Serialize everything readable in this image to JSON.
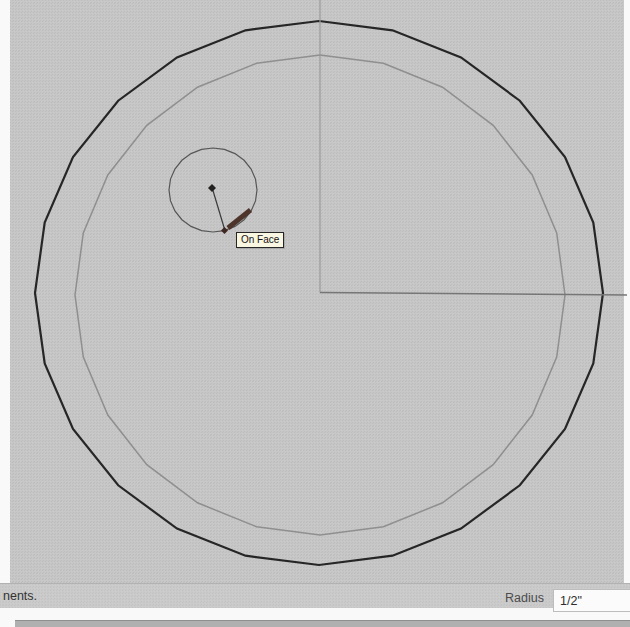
{
  "tooltip": {
    "label": "On Face",
    "bg": "#f9f6e2",
    "border": "#262626"
  },
  "status_bar": {
    "left_text": "nents.",
    "radius_label": "Radius",
    "radius_value": "1/2\""
  },
  "canvas": {
    "bg": "#c5c5c5"
  },
  "drawing": {
    "circles": [
      {
        "name": "outer-circle-edge",
        "cx": 319,
        "cy": 293,
        "rx": 284,
        "ry": 272,
        "segments": 24,
        "stroke": "#262626",
        "width": 2.2
      },
      {
        "name": "inner-circle-edge",
        "cx": 320,
        "cy": 295,
        "rx": 245,
        "ry": 240,
        "segments": 24,
        "stroke": "#8f8f8f",
        "width": 1.5
      },
      {
        "name": "new-circle-edge",
        "cx": 213,
        "cy": 190,
        "rx": 44,
        "ry": 42,
        "segments": 24,
        "stroke": "#565656",
        "width": 1.2
      }
    ],
    "lines": [
      {
        "name": "vertical-axis-edge",
        "x1": 320,
        "y1": 0,
        "x2": 320,
        "y2": 292.5,
        "stroke": "#9a9a9a",
        "width": 1.2
      },
      {
        "name": "horizontal-axis-edge",
        "x1": 320,
        "y1": 292.5,
        "x2": 627,
        "y2": 295,
        "stroke": "#767676",
        "width": 1.6
      },
      {
        "name": "radius-preview-line",
        "x1": 212.5,
        "y1": 189,
        "x2": 224.5,
        "y2": 229,
        "stroke": "#3a3a3a",
        "width": 1.2
      },
      {
        "name": "pencil-cursor",
        "x1": 228,
        "y1": 228,
        "x2": 250.5,
        "y2": 210,
        "stroke": "#4d352c",
        "width": 5,
        "cap": "butt"
      }
    ],
    "points": [
      {
        "name": "circle-center-point",
        "x": 212,
        "y": 188,
        "size": 4,
        "color": "#232020"
      },
      {
        "name": "on-face-inference-point",
        "x": 224.5,
        "y": 230.5,
        "size": 3.5,
        "color": "#3f2722"
      }
    ]
  }
}
